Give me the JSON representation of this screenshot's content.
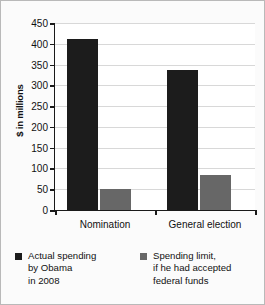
{
  "chart_data": {
    "type": "bar",
    "title": "",
    "subtitle": "",
    "xlabel": "",
    "ylabel": "$ in millions",
    "categories": [
      "Nomination",
      "General election"
    ],
    "series": [
      {
        "name": "Actual spending by Obama in 2008",
        "color": "#1c1c1c",
        "values": [
          412,
          338
        ]
      },
      {
        "name": "Spending limit, if he had accepted federal funds",
        "color": "#676767",
        "values": [
          50,
          85
        ]
      }
    ],
    "ylim": [
      0,
      450
    ],
    "ytick_step": 50,
    "ytick_labels": [
      "450",
      "400",
      "350",
      "300",
      "250",
      "200",
      "150",
      "100",
      "50",
      "0"
    ],
    "ytick_values": [
      450,
      400,
      350,
      300,
      250,
      200,
      150,
      100,
      50,
      0
    ],
    "grid": "horizontal",
    "legend_position": "bottom"
  },
  "legend": {
    "entries": [
      {
        "swatch": "legend-swatch-dark",
        "lines": [
          "Actual spending",
          "by Obama",
          "in 2008"
        ]
      },
      {
        "swatch": "legend-swatch-gray",
        "lines": [
          "Spending limit,",
          "if he had accepted",
          "federal funds"
        ]
      }
    ]
  },
  "colors": {
    "series_dark": "#1c1c1c",
    "series_gray": "#676767",
    "gridline": "#d8d8d8",
    "axis": "#1a1a1a",
    "background": "#fbfbfb",
    "plot_background": "#ffffff",
    "frame_border": "#b9b9b9"
  }
}
